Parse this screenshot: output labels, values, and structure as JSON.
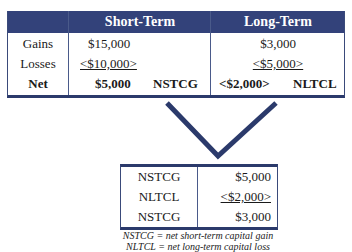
{
  "top_table": {
    "headers": [
      "",
      "Short-Term",
      "Long-Term"
    ],
    "rows": [
      {
        "label": "Gains",
        "short": "$15,000",
        "long": "$3,000"
      },
      {
        "label": "Losses",
        "short": "<$10,000>",
        "long": "<$5,000>"
      },
      {
        "label": "Net",
        "short": "$5,000",
        "short_tag": "NSTCG",
        "long": "<$2,000>",
        "long_tag": "NLTCL"
      }
    ]
  },
  "bottom_table": {
    "rows": [
      {
        "label": "NSTCG",
        "value": "$5,000"
      },
      {
        "label": "NLTCL",
        "value": "<$2,000>"
      },
      {
        "label": "NSTCG",
        "value": "$3,000"
      }
    ]
  },
  "notes": [
    "NSTCG = net short-term capital gain",
    "NLTCL = net long-term capital loss"
  ],
  "colors": {
    "header_bg": "#33427a",
    "border": "#2b3a6b"
  }
}
